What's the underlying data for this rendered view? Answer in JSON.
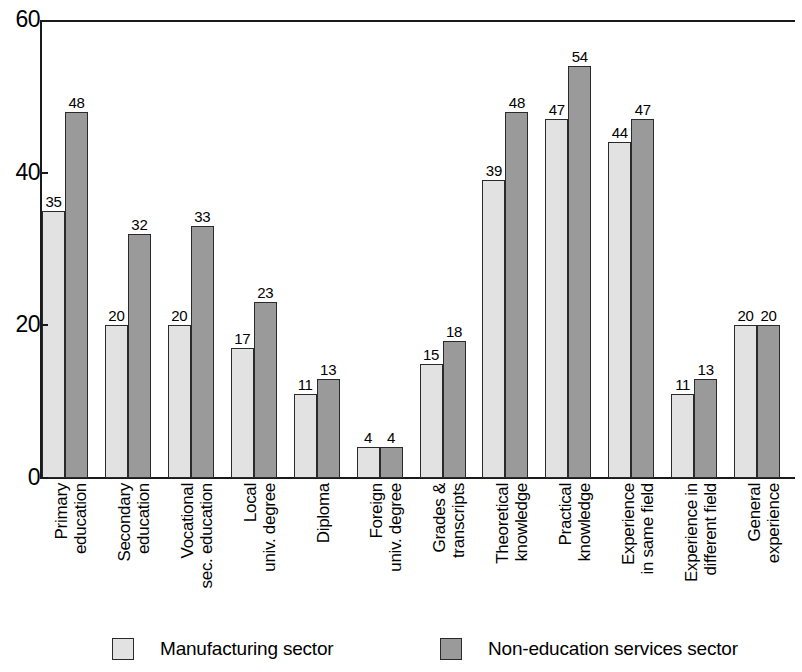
{
  "chart_data": {
    "type": "bar",
    "title": "",
    "subtitle": "",
    "xlabel": "",
    "ylabel": "",
    "ylim": [
      0,
      60
    ],
    "yticks": [
      0,
      20,
      40,
      60
    ],
    "ytick_labels": [
      "0",
      "20",
      "40",
      "60"
    ],
    "grid": false,
    "legend_position": "bottom",
    "value_labels": true,
    "categories": [
      "Primary education",
      "Secondary education",
      "Vocational sec. education",
      "Local univ. degree",
      "Diploma",
      "Foreign univ. degree",
      "Grades & transcripts",
      "Theoretical knowledge",
      "Practical knowledge",
      "Experience in same field",
      "Experience in different field",
      "General experience"
    ],
    "category_lines": [
      [
        "Primary",
        "education"
      ],
      [
        "Secondary",
        "education"
      ],
      [
        "Vocational",
        "sec. education"
      ],
      [
        "Local",
        "univ. degree"
      ],
      [
        "Diploma",
        ""
      ],
      [
        "Foreign",
        "univ. degree"
      ],
      [
        "Grades &",
        "transcripts"
      ],
      [
        "Theoretical",
        "knowledge"
      ],
      [
        "Practical",
        "knowledge"
      ],
      [
        "Experience",
        "in same field"
      ],
      [
        "Experience in",
        "different field"
      ],
      [
        "General",
        "experience"
      ]
    ],
    "series": [
      {
        "name": "Manufacturing sector",
        "color": "#e2e2e2",
        "values": [
          35,
          20,
          20,
          17,
          11,
          4,
          15,
          39,
          47,
          44,
          11,
          20
        ]
      },
      {
        "name": "Non-education services sector",
        "color": "#9a9a9a",
        "values": [
          48,
          32,
          33,
          23,
          13,
          4,
          18,
          48,
          54,
          47,
          13,
          20
        ]
      }
    ]
  },
  "legend": {
    "items": [
      {
        "label": "Manufacturing sector",
        "color": "#e2e2e2"
      },
      {
        "label": "Non-education services sector",
        "color": "#9a9a9a"
      }
    ]
  },
  "colors": {
    "axis": "#1a1a1a",
    "bar_outline": "#2a2a2a",
    "series_1": "#e2e2e2",
    "series_2": "#9a9a9a",
    "background": "#ffffff"
  }
}
